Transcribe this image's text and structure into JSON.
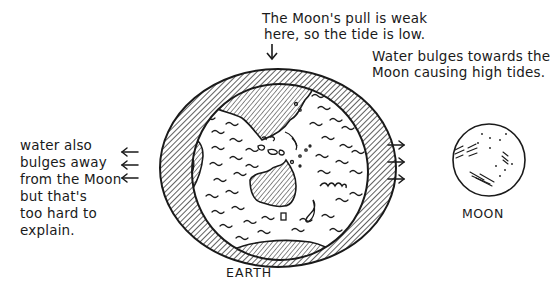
{
  "annotations": {
    "top": [
      "The Moon's pull is weak",
      "here, so the tide is low."
    ],
    "right": [
      "Water bulges towards the",
      "Moon causing high tides."
    ],
    "left": [
      "water also",
      "bulges away",
      "from the Moon",
      "but that's",
      "too hard to",
      "explain."
    ]
  },
  "bodies": {
    "earth_label": "EARTH",
    "moon_label": "MOON"
  },
  "arrows": {
    "top": "down",
    "left": [
      "left",
      "left",
      "left"
    ],
    "right": [
      "right",
      "right",
      "right"
    ]
  },
  "colors": {
    "ink": "#1a1a1a",
    "background": "#ffffff"
  }
}
